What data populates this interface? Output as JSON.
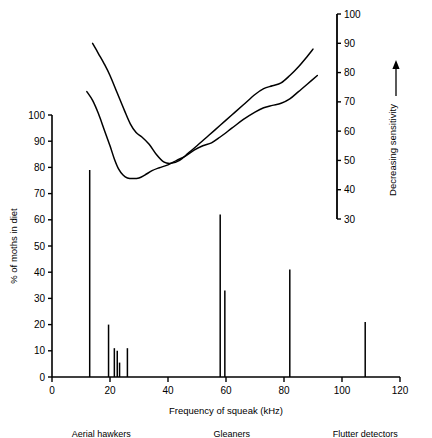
{
  "chart_data": {
    "type": "bar",
    "title": "",
    "xlabel": "Frequency of squeak (kHz)",
    "ylabel": "% of moths in diet",
    "y2label": "Decreasing sensitivity",
    "xlim": [
      0,
      120
    ],
    "ylim": [
      0,
      100
    ],
    "y2lim": [
      30,
      100
    ],
    "grid": false,
    "legend": "none",
    "xticks": [
      0,
      20,
      40,
      60,
      80,
      100,
      120
    ],
    "yticks": [
      0,
      10,
      20,
      30,
      40,
      50,
      60,
      70,
      80,
      90,
      100
    ],
    "y2ticks": [
      30,
      40,
      50,
      60,
      70,
      80,
      90,
      100
    ],
    "bars": [
      {
        "x": 13.0,
        "y": 79.0
      },
      {
        "x": 19.5,
        "y": 20.0
      },
      {
        "x": 21.5,
        "y": 11.0
      },
      {
        "x": 22.5,
        "y": 10.0
      },
      {
        "x": 23.3,
        "y": 5.5
      },
      {
        "x": 26.0,
        "y": 11.0
      },
      {
        "x": 58.0,
        "y": 62.0
      },
      {
        "x": 59.6,
        "y": 33.0
      },
      {
        "x": 82.0,
        "y": 41.0
      },
      {
        "x": 108.0,
        "y": 21.0
      }
    ],
    "series": [
      {
        "name": "audiogram-upper",
        "type": "line",
        "axis": "right",
        "points": [
          [
            14.0,
            90.0
          ],
          [
            16.0,
            86.5
          ],
          [
            18.0,
            83.0
          ],
          [
            20.0,
            79.0
          ],
          [
            22.5,
            73.0
          ],
          [
            25.0,
            67.0
          ],
          [
            27.0,
            62.5
          ],
          [
            29.0,
            59.5
          ],
          [
            31.0,
            58.0
          ],
          [
            33.5,
            55.5
          ],
          [
            36.0,
            52.0
          ],
          [
            38.5,
            49.5
          ],
          [
            41.0,
            49.0
          ],
          [
            44.0,
            50.0
          ],
          [
            47.0,
            52.5
          ],
          [
            50.0,
            55.0
          ],
          [
            54.0,
            58.5
          ],
          [
            58.0,
            62.0
          ],
          [
            62.0,
            65.5
          ],
          [
            66.0,
            69.0
          ],
          [
            70.0,
            72.5
          ],
          [
            73.0,
            74.5
          ],
          [
            76.0,
            75.5
          ],
          [
            79.0,
            76.5
          ],
          [
            82.0,
            79.0
          ],
          [
            85.0,
            82.0
          ],
          [
            88.0,
            85.5
          ],
          [
            90.0,
            88.0
          ]
        ]
      },
      {
        "name": "audiogram-lower",
        "type": "line",
        "axis": "right",
        "points": [
          [
            12.0,
            73.5
          ],
          [
            14.0,
            70.5
          ],
          [
            16.0,
            66.0
          ],
          [
            18.0,
            60.5
          ],
          [
            20.0,
            55.0
          ],
          [
            21.5,
            50.5
          ],
          [
            23.0,
            47.0
          ],
          [
            24.5,
            45.0
          ],
          [
            26.0,
            44.0
          ],
          [
            28.0,
            43.8
          ],
          [
            30.0,
            44.0
          ],
          [
            32.0,
            45.0
          ],
          [
            34.5,
            46.5
          ],
          [
            37.0,
            47.5
          ],
          [
            40.0,
            48.5
          ],
          [
            43.0,
            50.0
          ],
          [
            46.0,
            51.5
          ],
          [
            49.0,
            53.5
          ],
          [
            52.0,
            55.0
          ],
          [
            55.0,
            56.0
          ],
          [
            58.0,
            58.0
          ],
          [
            62.0,
            61.0
          ],
          [
            66.0,
            64.0
          ],
          [
            70.0,
            66.5
          ],
          [
            73.0,
            68.0
          ],
          [
            76.0,
            68.8
          ],
          [
            79.0,
            69.5
          ],
          [
            82.0,
            71.0
          ],
          [
            85.0,
            73.5
          ],
          [
            88.0,
            76.0
          ],
          [
            91.5,
            79.0
          ]
        ]
      }
    ],
    "categories": [
      {
        "label": "Aerial hawkers",
        "center_khz": 17
      },
      {
        "label": "Gleaners",
        "center_khz": 62
      },
      {
        "label": "Flutter detectors",
        "center_khz": 108
      }
    ],
    "annotations": [
      {
        "name": "decreasing-sensitivity-arrow",
        "symbol": "↑"
      }
    ]
  },
  "axes": {
    "x_label": "Frequency of squeak (kHz)",
    "y_label": "% of moths in diet",
    "y2_label": "Decreasing sensitivity"
  },
  "colors": {
    "ink": "#000000",
    "background": "#ffffff"
  }
}
